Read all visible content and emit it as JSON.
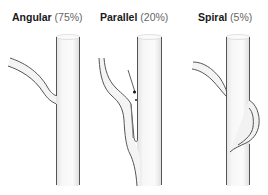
{
  "figure": {
    "panels": [
      {
        "name": "Angular",
        "percent": "(75%)"
      },
      {
        "name": "Parallel",
        "percent": "(20%)"
      },
      {
        "name": "Spiral",
        "percent": "(5%)"
      }
    ]
  },
  "colors": {
    "vessel_fill": "#f4f4f4",
    "vessel_outline": "#555555",
    "text": "#1a1a1a",
    "percent_text": "#666666"
  }
}
